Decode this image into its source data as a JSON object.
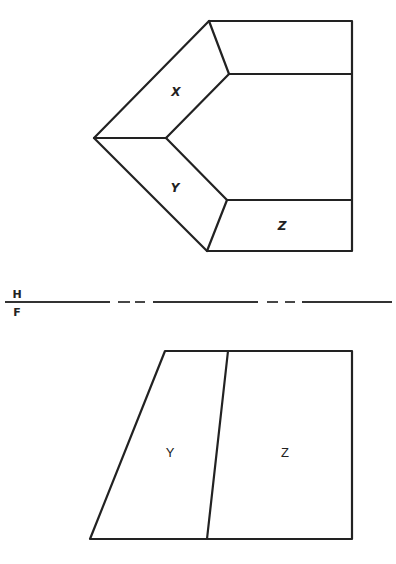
{
  "diagram": {
    "type": "orthographic-projection",
    "views": {
      "top": {
        "name": "horizontal-view",
        "faces": [
          {
            "id": "X",
            "label": "X",
            "label_pos": [
              176,
              96
            ]
          },
          {
            "id": "Y",
            "label": "Y",
            "label_pos": [
              175,
              192
            ]
          },
          {
            "id": "Z",
            "label": "Z",
            "label_pos": [
              282,
              230
            ]
          }
        ]
      },
      "front": {
        "name": "frontal-view",
        "faces": [
          {
            "id": "Y",
            "label": "Y",
            "label_pos": [
              170,
              457
            ]
          },
          {
            "id": "Z",
            "label": "Z",
            "label_pos": [
              285,
              457
            ]
          }
        ]
      }
    },
    "reference_line": {
      "upper_label": "H",
      "lower_label": "F",
      "y": 302
    },
    "colors": {
      "line": "#222222",
      "background": "#ffffff"
    }
  }
}
